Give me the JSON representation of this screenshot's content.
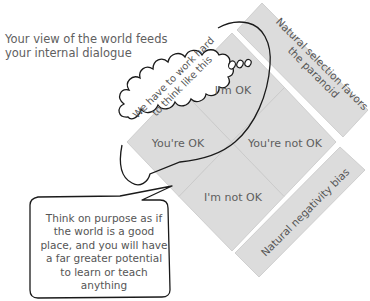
{
  "heading": {
    "line1": "Your view of the world feeds",
    "line2": "your internal dialogue"
  },
  "quadrants": {
    "top": "I'm OK",
    "left": "You're OK",
    "right": "You're not OK",
    "bottom": "I'm not OK"
  },
  "side_strips": {
    "upper_line1": "Natural selection favors",
    "upper_line2": "the paranoid",
    "lower": "Natural negativity bias"
  },
  "thought_bubble": {
    "line1": "We have to work hard",
    "line2": "to think like this"
  },
  "speech_bubble": {
    "text": "Think on purpose as if the world is a good place, and you will have a far greater potential to learn or teach anything"
  },
  "colors": {
    "tile_fill": "#dcdcdc",
    "tile_border": "#c4c4c4",
    "outline": "#1a1a1a",
    "text": "#555555"
  }
}
